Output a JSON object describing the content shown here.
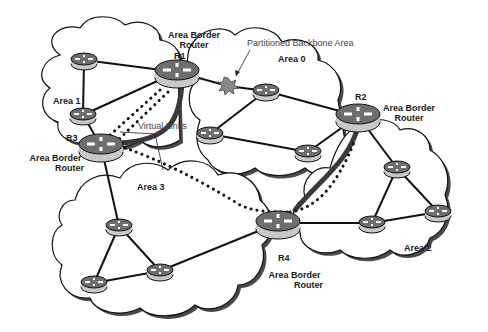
{
  "diagram": {
    "areas": [
      {
        "id": "area0",
        "label": "Area 0"
      },
      {
        "id": "area1",
        "label": "Area 1"
      },
      {
        "id": "area2",
        "label": "Area 2"
      },
      {
        "id": "area3",
        "label": "Area 3"
      }
    ],
    "border_routers": [
      {
        "id": "R1",
        "label": "R1",
        "role_line1": "Area Border",
        "role_line2": "Router"
      },
      {
        "id": "R2",
        "label": "R2",
        "role_line1": "Area Border",
        "role_line2": "Router"
      },
      {
        "id": "R3",
        "label": "R3",
        "role_line1": "Area Border",
        "role_line2": "Router"
      },
      {
        "id": "R4",
        "label": "R4",
        "role_line1": "Area Border",
        "role_line2": "Router"
      }
    ],
    "annotations": {
      "partition": "Partitioned Backbone Area",
      "virtual_links": "Virtual Links"
    },
    "colors": {
      "line": "#111111",
      "router_top": "#6e6e6e",
      "router_side": "#c8c8c8",
      "cloud_fill": "#ffffff",
      "cloud_shadow": "#555555",
      "burst": "#8a8a8a"
    }
  }
}
